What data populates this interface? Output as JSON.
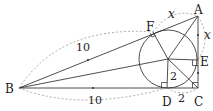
{
  "diagram": {
    "points": [
      {
        "id": "A",
        "label": "A",
        "x": 198,
        "y": 16
      },
      {
        "id": "B",
        "label": "B",
        "x": 19,
        "y": 88
      },
      {
        "id": "C",
        "label": "C",
        "x": 198,
        "y": 88
      },
      {
        "id": "D",
        "label": "D",
        "x": 167,
        "y": 88
      },
      {
        "id": "E",
        "label": "E",
        "x": 198,
        "y": 60
      },
      {
        "id": "F",
        "label": "F",
        "x": 153,
        "y": 32
      },
      {
        "id": "O",
        "label": "",
        "x": 168,
        "y": 59
      }
    ],
    "circle": {
      "center": "O",
      "radius": 29
    },
    "segment_labels": [
      {
        "text": "10",
        "between": "B-F",
        "style": "dashed-arc"
      },
      {
        "text": "10",
        "between": "B-D",
        "style": "dashed-arc"
      },
      {
        "text": "x",
        "between": "A-F",
        "style": "dashed-arc"
      },
      {
        "text": "x",
        "between": "A-E",
        "style": "dashed-arc"
      },
      {
        "text": "2",
        "between": "O-D"
      },
      {
        "text": "2",
        "between": "D-C",
        "style": "dashed-arc"
      }
    ],
    "labels": {
      "A": "A",
      "B": "B",
      "C": "C",
      "D": "D",
      "E": "E",
      "F": "F",
      "bf_length": "10",
      "bd_length": "10",
      "af_length": "x",
      "ae_length": "x",
      "od_length": "2",
      "dc_length": "2"
    },
    "colors": {
      "line": "#222222",
      "dashed": "#888888",
      "background": "#ffffff"
    }
  }
}
